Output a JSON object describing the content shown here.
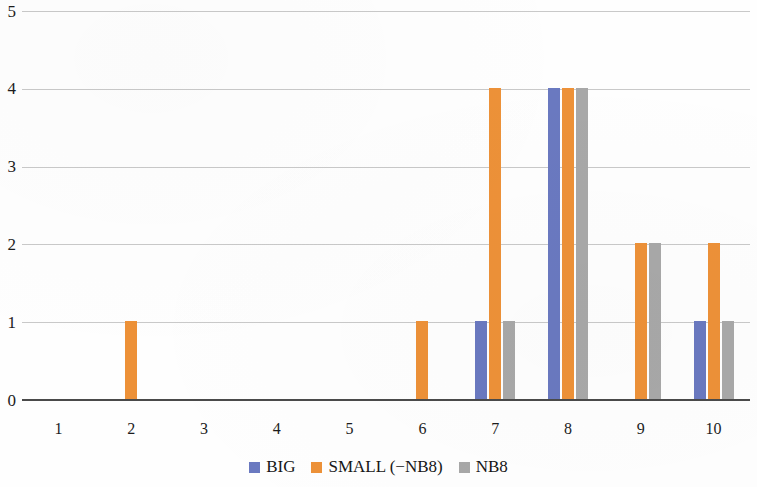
{
  "chart_data": {
    "type": "bar",
    "title": "",
    "subtitle": "",
    "xlabel": "",
    "ylabel": "",
    "categories": [
      "1",
      "2",
      "3",
      "4",
      "5",
      "6",
      "7",
      "8",
      "9",
      "10"
    ],
    "series": [
      {
        "name": "BIG",
        "color": "#6a79c0",
        "values": [
          0,
          0,
          0,
          0,
          0,
          0,
          1,
          4,
          0,
          1
        ]
      },
      {
        "name": "SMALL (−NB8)",
        "color": "#ed9138",
        "values": [
          0,
          1,
          0,
          0,
          0,
          1,
          4,
          4,
          2,
          2
        ]
      },
      {
        "name": "NB8",
        "color": "#a8a8a8",
        "values": [
          0,
          0,
          0,
          0,
          0,
          0,
          1,
          4,
          2,
          1
        ]
      }
    ],
    "ylim": [
      0,
      5
    ],
    "yticks": [
      "0",
      "1",
      "2",
      "3",
      "4",
      "5"
    ],
    "xticks": [
      "1",
      "2",
      "3",
      "4",
      "5",
      "6",
      "7",
      "8",
      "9",
      "10"
    ],
    "grid": true,
    "grid_axis": "y",
    "legend_position": "bottom",
    "legend": [
      "BIG",
      "SMALL (−NB8)",
      "NB8"
    ]
  },
  "axes": {
    "y_zero_label": "0",
    "baseline_color": "#4a4a4a",
    "gridline_color": "#c9c9c9"
  }
}
